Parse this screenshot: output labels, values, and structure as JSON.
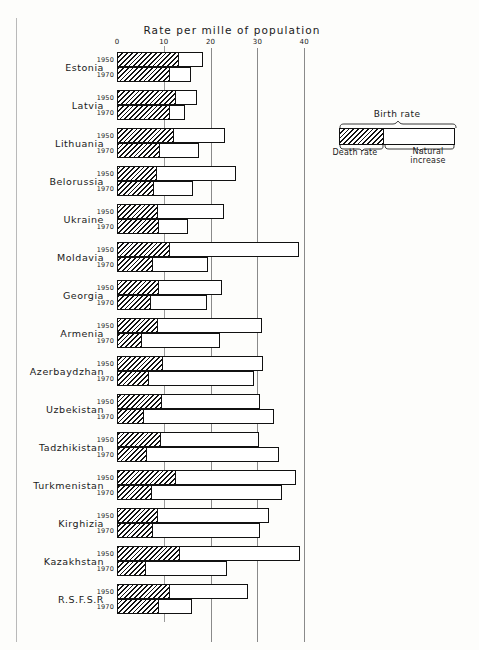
{
  "chart": {
    "axis_title": "Rate  per  mille  of  population",
    "type": "bar",
    "orientation": "horizontal-grouped-stacked",
    "xlabel": "Rate per mille of population",
    "ylabel": "",
    "xlim": [
      0,
      44
    ],
    "ticks": [
      0,
      10,
      20,
      30,
      40
    ],
    "tick_labels": [
      "0",
      "10",
      "20",
      "30",
      "40"
    ],
    "grid": "vertical",
    "series_names": [
      "Death rate",
      "Natural increase"
    ],
    "note": "Each bar = Birth rate, split into Death rate (hatched) + Natural increase (white)"
  },
  "legend": {
    "title": "Birth rate",
    "left_label": "Death rate",
    "right_label": "Natural\nincrease",
    "right_label_line1": "Natural",
    "right_label_line2": "increase",
    "position": "top-right"
  },
  "chart_data": {
    "type": "bar",
    "title": "Rate per mille of population",
    "xlabel": "Rate per mille of population",
    "ylabel": "",
    "xlim": [
      0,
      44
    ],
    "ticks": [
      0,
      10,
      20,
      30,
      40
    ],
    "grid": true,
    "legend": [
      "Birth rate",
      "Death rate",
      "Natural increase"
    ],
    "categories": [
      "Estonia",
      "Latvia",
      "Lithuania",
      "Belorussia",
      "Ukraine",
      "Moldavia",
      "Georgia",
      "Armenia",
      "Azerbaydzhan",
      "Uzbekistan",
      "Tadzhikistan",
      "Turkmenistan",
      "Kirghizia",
      "Kazakhstan",
      "R.S.F.S.R"
    ],
    "years": [
      "1950",
      "1970"
    ],
    "groups": [
      {
        "category": "Estonia",
        "rows": [
          {
            "year": "1950",
            "death_rate": 13.0,
            "birth_rate": 18.4
          },
          {
            "year": "1970",
            "death_rate": 11.1,
            "birth_rate": 15.8
          }
        ]
      },
      {
        "category": "Latvia",
        "rows": [
          {
            "year": "1950",
            "death_rate": 12.4,
            "birth_rate": 17.0
          },
          {
            "year": "1970",
            "death_rate": 11.2,
            "birth_rate": 14.5
          }
        ]
      },
      {
        "category": "Lithuania",
        "rows": [
          {
            "year": "1950",
            "death_rate": 12.0,
            "birth_rate": 23.0
          },
          {
            "year": "1970",
            "death_rate": 8.9,
            "birth_rate": 17.6
          }
        ]
      },
      {
        "category": "Belorussia",
        "rows": [
          {
            "year": "1950",
            "death_rate": 8.4,
            "birth_rate": 25.5
          },
          {
            "year": "1970",
            "death_rate": 7.6,
            "birth_rate": 16.2
          }
        ]
      },
      {
        "category": "Ukraine",
        "rows": [
          {
            "year": "1950",
            "death_rate": 8.5,
            "birth_rate": 22.8
          },
          {
            "year": "1970",
            "death_rate": 8.8,
            "birth_rate": 15.2
          }
        ]
      },
      {
        "category": "Moldavia",
        "rows": [
          {
            "year": "1950",
            "death_rate": 11.2,
            "birth_rate": 38.9
          },
          {
            "year": "1970",
            "death_rate": 7.4,
            "birth_rate": 19.4
          }
        ]
      },
      {
        "category": "Georgia",
        "rows": [
          {
            "year": "1950",
            "death_rate": 8.8,
            "birth_rate": 22.5
          },
          {
            "year": "1970",
            "death_rate": 7.0,
            "birth_rate": 19.2
          }
        ]
      },
      {
        "category": "Armenia",
        "rows": [
          {
            "year": "1950",
            "death_rate": 8.6,
            "birth_rate": 31.0
          },
          {
            "year": "1970",
            "death_rate": 5.1,
            "birth_rate": 22.1
          }
        ]
      },
      {
        "category": "Azerbaydzhan",
        "rows": [
          {
            "year": "1950",
            "death_rate": 9.6,
            "birth_rate": 31.2
          },
          {
            "year": "1970",
            "death_rate": 6.7,
            "birth_rate": 29.3
          }
        ]
      },
      {
        "category": "Uzbekistan",
        "rows": [
          {
            "year": "1950",
            "death_rate": 9.4,
            "birth_rate": 30.6
          },
          {
            "year": "1970",
            "death_rate": 5.6,
            "birth_rate": 33.5
          }
        ]
      },
      {
        "category": "Tadzhikistan",
        "rows": [
          {
            "year": "1950",
            "death_rate": 9.2,
            "birth_rate": 30.4
          },
          {
            "year": "1970",
            "death_rate": 6.3,
            "birth_rate": 34.7
          }
        ]
      },
      {
        "category": "Turkmenistan",
        "rows": [
          {
            "year": "1950",
            "death_rate": 12.3,
            "birth_rate": 38.2
          },
          {
            "year": "1970",
            "death_rate": 7.3,
            "birth_rate": 35.2
          }
        ]
      },
      {
        "category": "Kirghizia",
        "rows": [
          {
            "year": "1950",
            "death_rate": 8.5,
            "birth_rate": 32.4
          },
          {
            "year": "1970",
            "death_rate": 7.4,
            "birth_rate": 30.5
          }
        ]
      },
      {
        "category": "Kazakhstan",
        "rows": [
          {
            "year": "1950",
            "death_rate": 13.2,
            "birth_rate": 39.2
          },
          {
            "year": "1970",
            "death_rate": 6.0,
            "birth_rate": 23.4
          }
        ]
      },
      {
        "category": "R.S.F.S.R",
        "rows": [
          {
            "year": "1950",
            "death_rate": 11.2,
            "birth_rate": 28.0
          },
          {
            "year": "1970",
            "death_rate": 8.8,
            "birth_rate": 16.0
          }
        ]
      }
    ]
  }
}
